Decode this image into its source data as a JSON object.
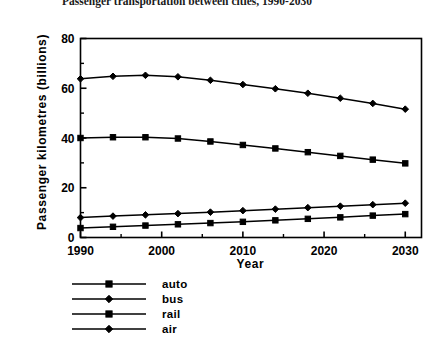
{
  "chart_data": {
    "type": "line",
    "title": "Passenger transportation between cities, 1990-2030",
    "xlabel": "Year",
    "ylabel": "Passenger  kilometres   (billions)",
    "x": [
      1990,
      1994,
      1998,
      2002,
      2006,
      2010,
      2014,
      2018,
      2022,
      2026,
      2030
    ],
    "xlim": [
      1990,
      2032
    ],
    "ylim": [
      0,
      80
    ],
    "xticks": [
      1990,
      2000,
      2010,
      2020,
      2030
    ],
    "xtick_labels": [
      "1990",
      "2000",
      "2010",
      "2020",
      "2030"
    ],
    "xminor_ticks": [
      1995,
      2005,
      2015,
      2025
    ],
    "yticks": [
      0,
      20,
      40,
      60,
      80
    ],
    "ytick_labels": [
      "0",
      "20",
      "40",
      "60",
      "80"
    ],
    "yminor_ticks": [
      10,
      30,
      50,
      70
    ],
    "grid": false,
    "legend_position": "below-left",
    "series": [
      {
        "name": "auto",
        "marker": "square",
        "values": [
          40.0,
          40.3,
          40.3,
          39.8,
          38.6,
          37.2,
          35.8,
          34.3,
          32.8,
          31.3,
          29.8
        ]
      },
      {
        "name": "bus",
        "marker": "diamond",
        "values": [
          8.0,
          8.6,
          9.1,
          9.6,
          10.2,
          10.8,
          11.4,
          12.0,
          12.6,
          13.2,
          13.8
        ]
      },
      {
        "name": "rail",
        "marker": "square",
        "values": [
          3.8,
          4.3,
          4.8,
          5.3,
          5.8,
          6.3,
          6.9,
          7.5,
          8.1,
          8.8,
          9.4
        ]
      },
      {
        "name": "air",
        "marker": "diamond",
        "values": [
          63.8,
          64.8,
          65.2,
          64.6,
          63.2,
          61.5,
          59.8,
          58.0,
          56.0,
          53.9,
          51.6
        ]
      }
    ]
  },
  "colors": {
    "line": "#000000",
    "background": "#ffffff",
    "text": "#000000"
  }
}
